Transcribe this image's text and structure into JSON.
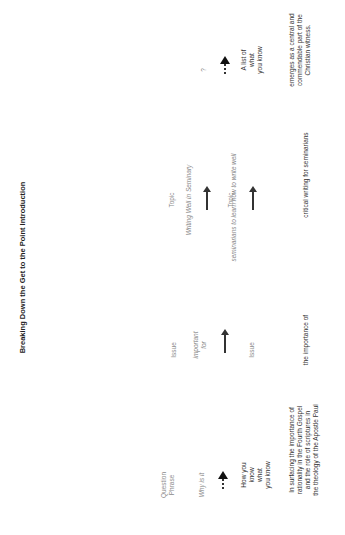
{
  "title": "Breaking Down the Get to the Point Introduction",
  "columns": {
    "question": {
      "header": "Question\nPhrase",
      "prompt": "Why is it",
      "result": "How you\nknow\nwhat\nyou know",
      "example": "In surfacing the importance of\nrationality in the Fourth Gospel\nand the role of scriptures in\nthe theology of the Apostle Paul"
    },
    "issue": {
      "header": "Issue",
      "prompt": "important\nfor",
      "result": "Issue",
      "example": "the  importance of"
    },
    "topic": {
      "header": "Topic",
      "prompt": "Writing Well in Seminary",
      "result": "Topic",
      "prompt2": "seminarians to learn how to write well",
      "result2": "Topic",
      "example": "critical writing for seminarians"
    },
    "list": {
      "prompt": "?",
      "result": "A list of\nwhat\nyou know",
      "example": "emerges as a central and\ncommendable part of the\nChristian witness."
    }
  },
  "connectors": {
    "question_arrow": "dotted-arrow",
    "issue_arrow": "solid-arrow",
    "topic_arrow_1": "solid-arrow",
    "topic_arrow_2": "solid-arrow",
    "list_arrow": "dotted-arrow"
  }
}
